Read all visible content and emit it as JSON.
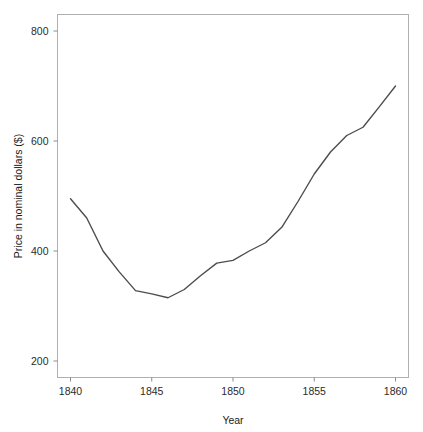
{
  "chart_data": {
    "type": "line",
    "title": "",
    "subtitle": "",
    "xlabel": "Year",
    "ylabel": "Price in nominal dollars ($)",
    "xlim": [
      1839.2,
      1860.8
    ],
    "ylim": [
      170,
      830
    ],
    "xticks": [
      1840,
      1845,
      1850,
      1855,
      1860
    ],
    "xticklabels": [
      "1840",
      "1845",
      "1850",
      "1855",
      "1860"
    ],
    "yticks": [
      200,
      400,
      600,
      800
    ],
    "yticklabels": [
      "200",
      "400",
      "600",
      "800"
    ],
    "grid": false,
    "legend": false,
    "legend_position": "none",
    "line_color": "#4d4d4d",
    "line_width": 1.4,
    "frame_color": "#b0b0b0",
    "background": "#ffffff",
    "x": [
      1840,
      1841,
      1842,
      1843,
      1844,
      1845,
      1846,
      1847,
      1848,
      1849,
      1850,
      1851,
      1852,
      1853,
      1854,
      1855,
      1856,
      1857,
      1858,
      1859,
      1860
    ],
    "series": [
      {
        "name": "Price in nominal dollars ($)",
        "values": [
          495,
          460,
          400,
          362,
          328,
          322,
          315,
          330,
          355,
          378,
          383,
          400,
          415,
          443,
          490,
          540,
          580,
          610,
          625,
          662,
          700
        ]
      }
    ]
  },
  "axes": {
    "y_label_text": "Price in nominal dollars ($)",
    "x_label_text": "Year"
  }
}
